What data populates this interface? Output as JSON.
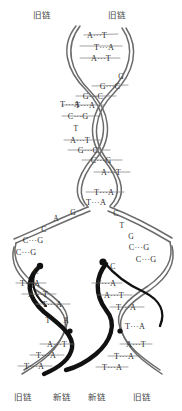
{
  "diagram": {
    "colors": {
      "old_strand": "#6b6b6b",
      "new_strand": "#111111",
      "base_text": "#2e2e2e",
      "label_text": "#4a4a4a",
      "background": "#ffffff"
    }
  },
  "labels": {
    "top": [
      {
        "text": "旧链",
        "x": 46,
        "y": 14
      },
      {
        "text": "旧链",
        "x": 121,
        "y": 14
      }
    ],
    "bottom": [
      {
        "text": "旧链",
        "x": 27,
        "y": 396
      },
      {
        "text": "新链",
        "x": 66,
        "y": 396
      },
      {
        "text": "新链",
        "x": 101,
        "y": 396
      },
      {
        "text": "旧链",
        "x": 146,
        "y": 396
      }
    ]
  },
  "base_pairs": {
    "parent_duplex": [
      {
        "text": "A···T",
        "x": 97,
        "y": 35
      },
      {
        "text": "T···A",
        "x": 104,
        "y": 47
      },
      {
        "text": "A···T",
        "x": 101,
        "y": 58
      },
      {
        "text": "G",
        "x": 121,
        "y": 76
      },
      {
        "text": "G···C",
        "x": 110,
        "y": 86
      },
      {
        "text": "G···C",
        "x": 93,
        "y": 96
      },
      {
        "text": "T···A",
        "x": 78,
        "y": 104
      },
      {
        "text": "T···A",
        "x": 85,
        "y": 105
      },
      {
        "text": "C···G",
        "x": 78,
        "y": 116
      },
      {
        "text": "T",
        "x": 76,
        "y": 128
      },
      {
        "text": "A···T",
        "x": 80,
        "y": 140
      },
      {
        "text": "G···C",
        "x": 88,
        "y": 150
      },
      {
        "text": "C···G",
        "x": 101,
        "y": 160
      },
      {
        "text": "A···T",
        "x": 111,
        "y": 172
      },
      {
        "text": "T···A",
        "x": 104,
        "y": 192
      },
      {
        "text": "T···A",
        "x": 96,
        "y": 202
      }
    ],
    "fork_left_open": [
      {
        "text": "G",
        "x": 73,
        "y": 212
      },
      {
        "text": "A",
        "x": 56,
        "y": 218
      },
      {
        "text": "C",
        "x": 44,
        "y": 229
      },
      {
        "text": "C···G",
        "x": 33,
        "y": 240
      },
      {
        "text": "C···G",
        "x": 26,
        "y": 252
      }
    ],
    "fork_right_open": [
      {
        "text": "C",
        "x": 116,
        "y": 213
      },
      {
        "text": "T",
        "x": 122,
        "y": 225
      },
      {
        "text": "G",
        "x": 131,
        "y": 236
      },
      {
        "text": "C···G",
        "x": 139,
        "y": 247
      },
      {
        "text": "C···G",
        "x": 146,
        "y": 259
      }
    ],
    "daughter_left": [
      {
        "text": "C",
        "x": 36,
        "y": 271
      },
      {
        "text": "T···A",
        "x": 30,
        "y": 283
      },
      {
        "text": "A···T",
        "x": 38,
        "y": 294
      },
      {
        "text": "T···A",
        "x": 52,
        "y": 304
      },
      {
        "text": "T",
        "x": 48,
        "y": 320
      },
      {
        "text": "A",
        "x": 66,
        "y": 320
      },
      {
        "text": "A···T",
        "x": 57,
        "y": 344
      },
      {
        "text": "T···A",
        "x": 46,
        "y": 355
      },
      {
        "text": "T···A",
        "x": 34,
        "y": 366
      }
    ],
    "daughter_right": [
      {
        "text": "C",
        "x": 113,
        "y": 266
      },
      {
        "text": "T···A",
        "x": 106,
        "y": 283
      },
      {
        "text": "A···T",
        "x": 114,
        "y": 295
      },
      {
        "text": "T···A",
        "x": 126,
        "y": 307
      },
      {
        "text": "T···A",
        "x": 135,
        "y": 326
      },
      {
        "text": "A···T",
        "x": 136,
        "y": 344
      },
      {
        "text": "T···A",
        "x": 124,
        "y": 356
      },
      {
        "text": "T···A",
        "x": 112,
        "y": 367
      }
    ]
  }
}
